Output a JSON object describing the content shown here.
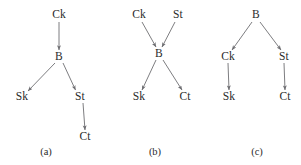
{
  "figure": {
    "width": 301,
    "height": 165,
    "background_color": "#ffffff",
    "edge_color": "#6e6e72",
    "label_color": "#2b2b2b"
  },
  "panels": [
    {
      "id": "a",
      "caption": "(a)",
      "caption_pos": {
        "x": 46,
        "y": 152
      },
      "nodes": [
        {
          "id": "a-ck",
          "label": "Ck",
          "x": 59,
          "y": 15
        },
        {
          "id": "a-b",
          "label": "B",
          "x": 59,
          "y": 57
        },
        {
          "id": "a-sk",
          "label": "Sk",
          "x": 22,
          "y": 97
        },
        {
          "id": "a-st",
          "label": "St",
          "x": 80,
          "y": 97
        },
        {
          "id": "a-ct",
          "label": "Ct",
          "x": 85,
          "y": 137
        }
      ],
      "edges": [
        {
          "from": "Ck",
          "to": "B",
          "x1": 59,
          "y1": 22,
          "x2": 59,
          "y2": 50
        },
        {
          "from": "B",
          "to": "Sk",
          "x1": 55,
          "y1": 63,
          "x2": 28,
          "y2": 91
        },
        {
          "from": "B",
          "to": "St",
          "x1": 63,
          "y1": 63,
          "x2": 75.5,
          "y2": 90
        },
        {
          "from": "St",
          "to": "Ct",
          "x1": 83,
          "y1": 103,
          "x2": 85,
          "y2": 130
        }
      ]
    },
    {
      "id": "b",
      "caption": "(b)",
      "caption_pos": {
        "x": 155,
        "y": 152
      },
      "nodes": [
        {
          "id": "b-ck",
          "label": "Ck",
          "x": 139,
          "y": 15
        },
        {
          "id": "b-st",
          "label": "St",
          "x": 178,
          "y": 15
        },
        {
          "id": "b-b",
          "label": "B",
          "x": 159,
          "y": 54
        },
        {
          "id": "b-sk",
          "label": "Sk",
          "x": 139,
          "y": 97
        },
        {
          "id": "b-ct",
          "label": "Ct",
          "x": 185,
          "y": 97
        }
      ],
      "edges": [
        {
          "from": "Ck",
          "to": "B",
          "x1": 142,
          "y1": 22,
          "x2": 156,
          "y2": 47
        },
        {
          "from": "St",
          "to": "B",
          "x1": 175,
          "y1": 22,
          "x2": 162,
          "y2": 47
        },
        {
          "from": "B",
          "to": "Sk",
          "x1": 156,
          "y1": 60,
          "x2": 142,
          "y2": 90
        },
        {
          "from": "B",
          "to": "Ct",
          "x1": 163,
          "y1": 60,
          "x2": 182,
          "y2": 90
        }
      ]
    },
    {
      "id": "c",
      "caption": "(c)",
      "caption_pos": {
        "x": 257,
        "y": 152
      },
      "nodes": [
        {
          "id": "c-b",
          "label": "B",
          "x": 256,
          "y": 15
        },
        {
          "id": "c-ck",
          "label": "Ck",
          "x": 228,
          "y": 57
        },
        {
          "id": "c-st",
          "label": "St",
          "x": 284,
          "y": 57
        },
        {
          "id": "c-sk",
          "label": "Sk",
          "x": 229,
          "y": 97
        },
        {
          "id": "c-ct",
          "label": "Ct",
          "x": 285,
          "y": 97
        }
      ],
      "edges": [
        {
          "from": "B",
          "to": "Ck",
          "x1": 252,
          "y1": 22,
          "x2": 232,
          "y2": 50
        },
        {
          "from": "B",
          "to": "St",
          "x1": 260,
          "y1": 22,
          "x2": 281,
          "y2": 50
        },
        {
          "from": "Ck",
          "to": "Sk",
          "x1": 228,
          "y1": 63,
          "x2": 229,
          "y2": 90
        },
        {
          "from": "St",
          "to": "Ct",
          "x1": 284,
          "y1": 63,
          "x2": 285,
          "y2": 90
        }
      ]
    }
  ]
}
